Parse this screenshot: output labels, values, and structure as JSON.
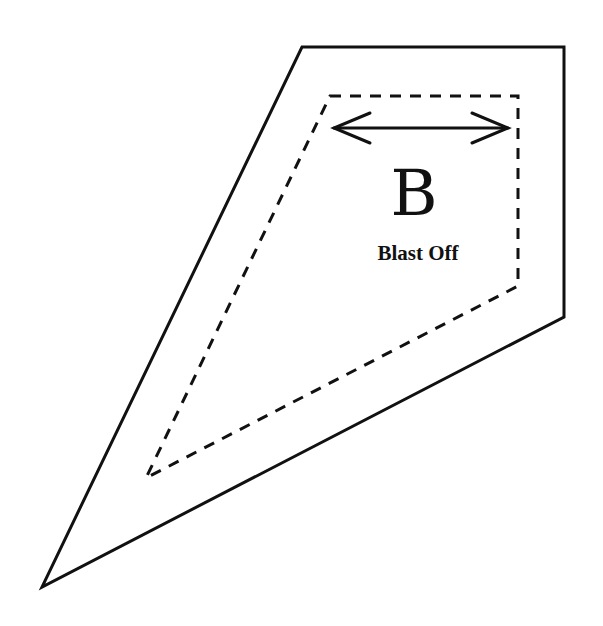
{
  "template": {
    "letter": "B",
    "name": "Blast Off",
    "stroke_color": "#111111",
    "background": "#ffffff",
    "outer_cut_line": {
      "style": "solid",
      "points": [
        [
          302,
          47
        ],
        [
          564,
          47
        ],
        [
          564,
          317
        ],
        [
          42,
          587
        ]
      ]
    },
    "inner_seam_line": {
      "style": "dashed",
      "points": [
        [
          330,
          96
        ],
        [
          518,
          96
        ],
        [
          518,
          286
        ],
        [
          146,
          478
        ]
      ]
    },
    "grain_arrow": {
      "type": "double-headed",
      "from": [
        334,
        128
      ],
      "to": [
        508,
        128
      ]
    }
  }
}
